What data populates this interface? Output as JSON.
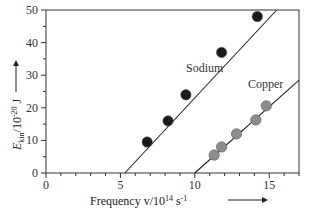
{
  "chart_data": {
    "type": "scatter",
    "title": "",
    "xlabel": "Frequency v/10^14 s^-1",
    "ylabel": "E_kin/10^-20 J",
    "xlim": [
      0,
      17
    ],
    "ylim": [
      0,
      50
    ],
    "x_ticks": [
      0,
      5,
      10,
      15
    ],
    "y_ticks": [
      0,
      10,
      20,
      30,
      40,
      50
    ],
    "grid": false,
    "legend": "inline labels",
    "series": [
      {
        "name": "Sodium",
        "marker_color": "#1a1a1a",
        "points": [
          [
            6.8,
            9.5
          ],
          [
            8.2,
            16.0
          ],
          [
            9.4,
            24.0
          ],
          [
            11.8,
            37.0
          ],
          [
            14.2,
            48.0
          ]
        ],
        "fit_line": [
          [
            5.3,
            0
          ],
          [
            15.5,
            50
          ]
        ]
      },
      {
        "name": "Copper",
        "marker_color": "#8c8c8c",
        "points": [
          [
            11.3,
            5.5
          ],
          [
            11.8,
            8.0
          ],
          [
            12.8,
            12.0
          ],
          [
            14.1,
            16.3
          ],
          [
            14.8,
            20.6
          ]
        ],
        "fit_line": [
          [
            10.0,
            0
          ],
          [
            17.0,
            28.5
          ]
        ]
      }
    ]
  },
  "labels": {
    "sodium": "Sodium",
    "copper": "Copper",
    "x_axis_main": "Frequency v/10",
    "x_axis_exp": "14",
    "x_axis_unit": " s",
    "x_axis_unit_exp": "-1",
    "y_axis_E": "E",
    "y_axis_sub": "kin",
    "y_axis_rest": "/10",
    "y_axis_exp": "-20",
    "y_axis_unit": " J"
  }
}
